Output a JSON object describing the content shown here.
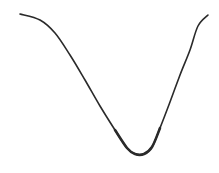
{
  "chart_data": {
    "type": "line",
    "title": "",
    "xlabel": "",
    "ylabel": "",
    "grid": false,
    "legend": null,
    "axes_visible": false,
    "series": [
      {
        "name": "curve",
        "color": "#2a2a2a",
        "points_px": [
          [
            20,
            14
          ],
          [
            40,
            20
          ],
          [
            55,
            33
          ],
          [
            70,
            55
          ],
          [
            85,
            80
          ],
          [
            100,
            106
          ],
          [
            115,
            130
          ],
          [
            127,
            148
          ],
          [
            135,
            154
          ],
          [
            144,
            154
          ],
          [
            152,
            147
          ],
          [
            160,
            128
          ],
          [
            170,
            102
          ],
          [
            180,
            75
          ],
          [
            190,
            50
          ],
          [
            198,
            26
          ],
          [
            208,
            15
          ]
        ]
      }
    ]
  },
  "colors": {
    "background": "#ffffff",
    "line": "#2a2a2a"
  }
}
